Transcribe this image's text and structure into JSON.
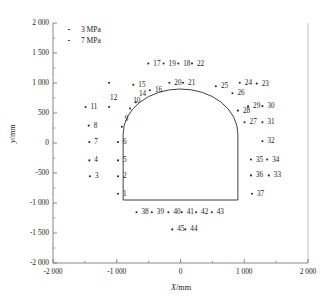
{
  "chart_data": {
    "type": "scatter",
    "title": "",
    "xlabel": "X/mm",
    "ylabel": "y/mm",
    "xlim": [
      -2000,
      2000
    ],
    "ylim": [
      -2000,
      2000
    ],
    "grid": false,
    "legend_position": "top-left",
    "x_ticks": [
      {
        "value": -2000,
        "label": "-2 000"
      },
      {
        "value": -1000,
        "label": "-1 000"
      },
      {
        "value": 0,
        "label": "0"
      },
      {
        "value": 1000,
        "label": "1 000"
      },
      {
        "value": 2000,
        "label": "2 000"
      }
    ],
    "x_minor_ticks": [
      -1500,
      -500,
      500,
      1500
    ],
    "y_ticks": [
      {
        "value": 2000,
        "label": "2 000"
      },
      {
        "value": 1500,
        "label": "1 500"
      },
      {
        "value": 1000,
        "label": "1 000"
      },
      {
        "value": 500,
        "label": "500"
      },
      {
        "value": 0,
        "label": "0"
      },
      {
        "value": -500,
        "label": "-500"
      },
      {
        "value": -1000,
        "label": "-1 000"
      },
      {
        "value": -1500,
        "label": "-1 500"
      },
      {
        "value": -2000,
        "label": "-2 000"
      }
    ],
    "legend": [
      {
        "label": "3 MPa",
        "marker": "dot",
        "color": "#2b2b2b"
      },
      {
        "label": "7 MPa",
        "marker": "dot",
        "color": "#2b2b2b"
      }
    ],
    "series": [
      {
        "name": "measurement points",
        "marker": "dot",
        "color": "#2b2b2b",
        "points": [
          {
            "label": "1",
            "x": -980,
            "y": -845,
            "lx": 5,
            "ly": -3
          },
          {
            "label": "2",
            "x": -980,
            "y": -555,
            "lx": 5,
            "ly": -3
          },
          {
            "label": "3",
            "x": -1420,
            "y": -555,
            "lx": 5,
            "ly": -3
          },
          {
            "label": "4",
            "x": -1430,
            "y": -290,
            "lx": 5,
            "ly": -3
          },
          {
            "label": "5",
            "x": -980,
            "y": -290,
            "lx": 5,
            "ly": -3
          },
          {
            "label": "6",
            "x": -980,
            "y": 15,
            "lx": 5,
            "ly": -3
          },
          {
            "label": "7",
            "x": -1430,
            "y": 15,
            "lx": 5,
            "ly": -3
          },
          {
            "label": "8",
            "x": -1440,
            "y": 290,
            "lx": 5,
            "ly": -3
          },
          {
            "label": "9",
            "x": -920,
            "y": 270,
            "lx": 3,
            "ly": -11
          },
          {
            "label": "10",
            "x": -790,
            "y": 575,
            "lx": 3,
            "ly": -11
          },
          {
            "label": "11",
            "x": -1490,
            "y": 600,
            "lx": 5,
            "ly": -3
          },
          {
            "label": "12",
            "x": -1120,
            "y": 600,
            "lx": 1,
            "ly": -12
          },
          {
            "label": "14",
            "x": -700,
            "y": 680,
            "lx": 3,
            "ly": -11
          },
          {
            "label": "15",
            "x": -740,
            "y": 970,
            "lx": 5,
            "ly": -3
          },
          {
            "label": "16",
            "x": -480,
            "y": 880,
            "lx": 5,
            "ly": -3
          },
          {
            "label": "17",
            "x": -505,
            "y": 1325,
            "lx": 5,
            "ly": -3
          },
          {
            "label": "18",
            "x": -35,
            "y": 1325,
            "lx": 5,
            "ly": -3
          },
          {
            "label": "19",
            "x": -265,
            "y": 1325,
            "lx": 5,
            "ly": -3
          },
          {
            "label": "20",
            "x": -175,
            "y": 1005,
            "lx": 5,
            "ly": -3
          },
          {
            "label": "21",
            "x": 40,
            "y": 1005,
            "lx": 5,
            "ly": -3
          },
          {
            "label": "22",
            "x": 180,
            "y": 1325,
            "lx": 5,
            "ly": -3
          },
          {
            "label": "23",
            "x": 1195,
            "y": 990,
            "lx": 5,
            "ly": -3
          },
          {
            "label": "24",
            "x": 930,
            "y": 1005,
            "lx": 5,
            "ly": -3
          },
          {
            "label": "25",
            "x": 555,
            "y": 945,
            "lx": 5,
            "ly": -3
          },
          {
            "label": "26",
            "x": 815,
            "y": 830,
            "lx": 5,
            "ly": -3
          },
          {
            "label": "27",
            "x": 1005,
            "y": 345,
            "lx": 5,
            "ly": -3
          },
          {
            "label": "28",
            "x": 900,
            "y": 540,
            "lx": 5,
            "ly": -3
          },
          {
            "label": "29",
            "x": 1060,
            "y": 610,
            "lx": 5,
            "ly": -3
          },
          {
            "label": "30",
            "x": 1285,
            "y": 615,
            "lx": 5,
            "ly": -3
          },
          {
            "label": "31",
            "x": 1285,
            "y": 345,
            "lx": 5,
            "ly": -3
          },
          {
            "label": "32",
            "x": 1285,
            "y": 30,
            "lx": 5,
            "ly": -3
          },
          {
            "label": "33",
            "x": 1385,
            "y": -540,
            "lx": 5,
            "ly": -3
          },
          {
            "label": "34",
            "x": 1360,
            "y": -275,
            "lx": 5,
            "ly": -3
          },
          {
            "label": "35",
            "x": 1105,
            "y": -275,
            "lx": 5,
            "ly": -3
          },
          {
            "label": "36",
            "x": 1105,
            "y": -540,
            "lx": 5,
            "ly": -3
          },
          {
            "label": "37",
            "x": 1120,
            "y": -845,
            "lx": 5,
            "ly": -3
          },
          {
            "label": "38",
            "x": -690,
            "y": -1155,
            "lx": 5,
            "ly": -3
          },
          {
            "label": "39",
            "x": -450,
            "y": -1155,
            "lx": 5,
            "ly": -3
          },
          {
            "label": "40",
            "x": -190,
            "y": -1155,
            "lx": 5,
            "ly": -3
          },
          {
            "label": "41",
            "x": 20,
            "y": -1155,
            "lx": 5,
            "ly": -3
          },
          {
            "label": "42",
            "x": 245,
            "y": -1155,
            "lx": 5,
            "ly": -3
          },
          {
            "label": "43",
            "x": 490,
            "y": -1155,
            "lx": 5,
            "ly": -3
          },
          {
            "label": "44",
            "x": 75,
            "y": -1440,
            "lx": 5,
            "ly": -3
          },
          {
            "label": "45",
            "x": -130,
            "y": -1440,
            "lx": 5,
            "ly": -3
          },
          {
            "label": "",
            "x": -1120,
            "y": 1005,
            "lx": 5,
            "ly": -3
          }
        ]
      }
    ],
    "tunnel_outline": {
      "description": "horseshoe tunnel cross-section",
      "wall_left_x": -900,
      "wall_right_x": 900,
      "floor_y": -950,
      "spring_line_y": 150,
      "crown_y": 900,
      "arch_radius": 900
    }
  }
}
